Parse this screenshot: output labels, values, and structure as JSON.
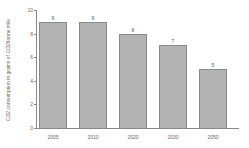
{
  "chart_data": {
    "type": "bar",
    "title": "",
    "xlabel": "",
    "ylabel": "CO2 consumption in grams of CO2/tonne mile",
    "categories": [
      "2005",
      "2010",
      "2020",
      "2030",
      "2050"
    ],
    "values": [
      9,
      9,
      8,
      7,
      5
    ],
    "data_labels": [
      "9",
      "9",
      "8",
      "7",
      "5"
    ],
    "ylim": [
      0,
      10
    ],
    "yticks": [
      "0",
      "2",
      "4",
      "6",
      "8",
      "10"
    ],
    "grid": false,
    "legend": null,
    "bar_color": "#b3b3b3"
  }
}
